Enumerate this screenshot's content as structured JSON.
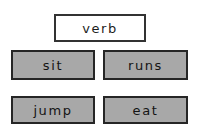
{
  "canvas": {
    "width": 204,
    "height": 126,
    "background_color": "#ffffff"
  },
  "colors": {
    "background": "#ffffff",
    "prompt_fill": "#ffffff",
    "option_fill": "#a8a8a8",
    "border": "#2b2b2b",
    "text": "#1c1c1c"
  },
  "prompt": {
    "label": "verb"
  },
  "options": [
    {
      "label": "sit"
    },
    {
      "label": "runs"
    },
    {
      "label": "jump"
    },
    {
      "label": "eat"
    }
  ]
}
